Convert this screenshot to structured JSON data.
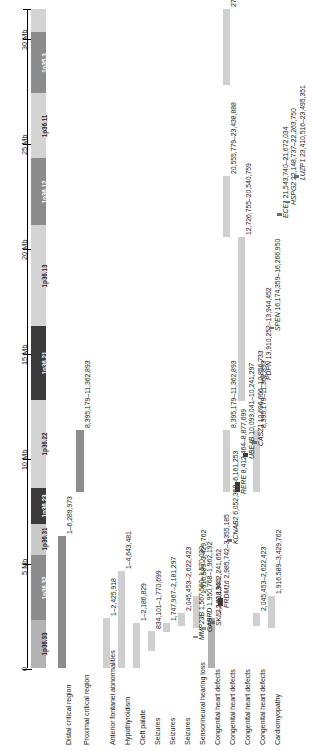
{
  "figure": {
    "orientation": "rotated-90",
    "axis": {
      "unit": "Mb",
      "min": 0,
      "max": 31.5,
      "ticks": [
        {
          "value": 0,
          "label": "0"
        },
        {
          "value": 5,
          "label": "5 Mb"
        },
        {
          "value": 10,
          "label": "10 Mb"
        },
        {
          "value": 15,
          "label": "15 Mb"
        },
        {
          "value": 20,
          "label": "20 Mb"
        },
        {
          "value": 25,
          "label": "25 Mb"
        },
        {
          "value": 30,
          "label": "30 Mb"
        }
      ]
    },
    "ideogram": {
      "bands": [
        {
          "label": "1p36.33",
          "start": 0.0,
          "end": 2.3,
          "color": "#b3b3b3"
        },
        {
          "label": "1p36.32",
          "start": 2.3,
          "end": 5.4,
          "color": "#8c8c8c"
        },
        {
          "label": "1p36.31",
          "start": 5.4,
          "end": 6.9,
          "color": "#c9c9c9"
        },
        {
          "label": "1p36.23",
          "start": 6.9,
          "end": 8.6,
          "color": "#3a3a3a"
        },
        {
          "label": "1p36.22",
          "start": 8.6,
          "end": 12.8,
          "color": "#d4d4d4"
        },
        {
          "label": "1p36.21",
          "start": 12.8,
          "end": 16.3,
          "color": "#3a3a3a"
        },
        {
          "label": "1p36.13",
          "start": 16.3,
          "end": 21.1,
          "color": "#d4d4d4"
        },
        {
          "label": "1p36.12",
          "start": 21.1,
          "end": 24.3,
          "color": "#8c8c8c"
        },
        {
          "label": "1p36.11",
          "start": 24.3,
          "end": 27.4,
          "color": "#d4d4d4"
        },
        {
          "label": "1p35.3",
          "start": 27.4,
          "end": 30.3,
          "color": "#8c8c8c"
        },
        {
          "label": "",
          "start": 30.3,
          "end": 31.4,
          "color": "#d4d4d4"
        }
      ]
    },
    "regions": [
      {
        "name": "Distal critical region",
        "bars": [
          {
            "start": 1,
            "end": 6289973,
            "label": "1–6,289,973",
            "color": "#8c8c8c"
          }
        ]
      },
      {
        "name": "Proximal critical region",
        "bars": [
          {
            "start": 8395179,
            "end": 11362893,
            "label": "8,395,179–11,362,893",
            "color": "#8c8c8c"
          }
        ]
      }
    ],
    "phenotypes": [
      {
        "name": "Anterior fontanel abnormalities",
        "bars": [
          {
            "start": 1,
            "end": 2425918,
            "label": "1–2,425,918",
            "color": "#cfcfcf"
          }
        ]
      },
      {
        "name": "Hypothyroidism",
        "bars": [
          {
            "start": 1,
            "end": 4643481,
            "label": "1–4,643,481",
            "color": "#cfcfcf"
          }
        ]
      },
      {
        "name": "Cleft palate",
        "bars": [
          {
            "start": 1,
            "end": 2186829,
            "label": "1–2,186,829",
            "color": "#cfcfcf"
          }
        ]
      },
      {
        "name": "Seizures",
        "bars": [
          {
            "start": 834101,
            "end": 1770699,
            "label": "834,101–1,770,699",
            "color": "#cfcfcf"
          }
        ]
      },
      {
        "name": "Seizures",
        "bars": [
          {
            "start": 1747967,
            "end": 2181297,
            "label": "1,747,967–2,181,297",
            "color": "#cfcfcf"
          }
        ]
      },
      {
        "name": "Seizures",
        "bars": [
          {
            "start": 2045453,
            "end": 2622423,
            "label": "2,045,453–2,622,423",
            "color": "#cfcfcf"
          }
        ]
      },
      {
        "name": "Sensorineural hearing loss",
        "bars": [
          {
            "start": 1916589,
            "end": 3429762,
            "label": "1,916,589–3,429,762",
            "color": "#cfcfcf"
          }
        ]
      },
      {
        "name": "Congenital heart defects",
        "bars": [
          {
            "start": 1,
            "end": 2418935,
            "label": "1–2,418,935",
            "color": "#b0b0b0"
          }
        ]
      },
      {
        "name": "Congenital heart defects",
        "bars": [
          {
            "start": 8395179,
            "end": 11362893,
            "label": "8,395,179–11,362,893",
            "color": "#cfcfcf"
          },
          {
            "start": 20555779,
            "end": 23438888,
            "label": "20,555,779–23,438,888",
            "color": "#cfcfcf"
          },
          {
            "start": 27803719,
            "end": 31404471,
            "label": "27,803,719–31,404,471",
            "color": "#cfcfcf"
          }
        ]
      },
      {
        "name": "Congenital heart defects",
        "bars": [
          {
            "start": 12726755,
            "end": 20540759,
            "label": "12,726,755–20,540,759",
            "color": "#cfcfcf"
          }
        ]
      },
      {
        "name": "Congenital heart defects",
        "bars": [
          {
            "start": 2045453,
            "end": 2622423,
            "label": "2,045,453–2,622,423",
            "color": "#cfcfcf"
          },
          {
            "start": 8395179,
            "end": 11362893,
            "label": "8,395,179–11,362,893",
            "color": "#cfcfcf"
          }
        ]
      },
      {
        "name": "Cardiomyopathy",
        "bars": [
          {
            "start": 1916589,
            "end": 3429762,
            "label": "1,916,589–3,429,762",
            "color": "#cfcfcf"
          }
        ]
      }
    ],
    "genes": [
      {
        "symbol": "MMP23B",
        "range": "1,567,560–1,570,030",
        "start": 1567560,
        "end": 1570030,
        "label": "MMP23B 1,567,560–1,570,030",
        "color": "#8c8c8c"
      },
      {
        "symbol": "GABRD",
        "range": "1,950,768–1,962,192",
        "start": 1950768,
        "end": 1962192,
        "label": "GABRD 1,950,768–1,962,192",
        "color": "#8c8c8c"
      },
      {
        "symbol": "SKI",
        "range": "2,160,134–2,241,652",
        "start": 2160134,
        "end": 2241652,
        "label": "SKI 2,160,134–2,241,652",
        "color": "#6e6e6e"
      },
      {
        "symbol": "PRDM16",
        "range": "2,985,742–3,355,185",
        "start": 2985742,
        "end": 3355185,
        "label": "PRDM16 2,985,742–3,355,185",
        "color": "#3a3a3a"
      },
      {
        "symbol": "KCNAB2",
        "range": "6,052,358–6,161,253",
        "start": 6052358,
        "end": 6161253,
        "label": "KCNAB2 6,052,358–6,161,253",
        "color": "#6e6e6e"
      },
      {
        "symbol": "RERE",
        "range": "8,412,464–8,877,699",
        "start": 8412464,
        "end": 8877699,
        "label": "RERE 8,412,464–8,877,699",
        "color": "#3a3a3a"
      },
      {
        "symbol": "UBE4B",
        "range": "10,093,041–10,241,297",
        "start": 10093041,
        "end": 10241297,
        "label": "UBE4B 10,093,041–10,241,297",
        "color": "#3a3a3a"
      },
      {
        "symbol": "CASZ1",
        "range": "10,696,666–10,856,733",
        "start": 10696666,
        "end": 10856733,
        "label": "CASZ1 10,696,666–10,856,733",
        "color": "#6e6e6e"
      },
      {
        "symbol": "PDPN",
        "range": "13,910,252–13,944,452",
        "start": 13910252,
        "end": 13944452,
        "label": "PDPN 13,910,252–13,944,452",
        "color": "#8c8c8c"
      },
      {
        "symbol": "SPEN",
        "range": "16,174,359–16,266,950",
        "start": 16174359,
        "end": 16266950,
        "label": "SPEN 16,174,359–16,266,950",
        "color": "#6e6e6e"
      },
      {
        "symbol": "ECE1",
        "range": "21,543,740–21,672,034",
        "start": 21543740,
        "end": 21672034,
        "label": "ECE1 21,543,740–21,672,034",
        "color": "#6e6e6e"
      },
      {
        "symbol": "HSPG2",
        "range": "22,148,737–22,263,750",
        "start": 22148737,
        "end": 22263750,
        "label": "HSPG2 22,148,737–22,263,750",
        "color": "#6e6e6e"
      },
      {
        "symbol": "LUZP1",
        "range": "23,410,516–23,495,351",
        "start": 23410516,
        "end": 23495351,
        "label": "LUZP1 23,410,516–23,495,351",
        "color": "#6e6e6e"
      }
    ]
  }
}
